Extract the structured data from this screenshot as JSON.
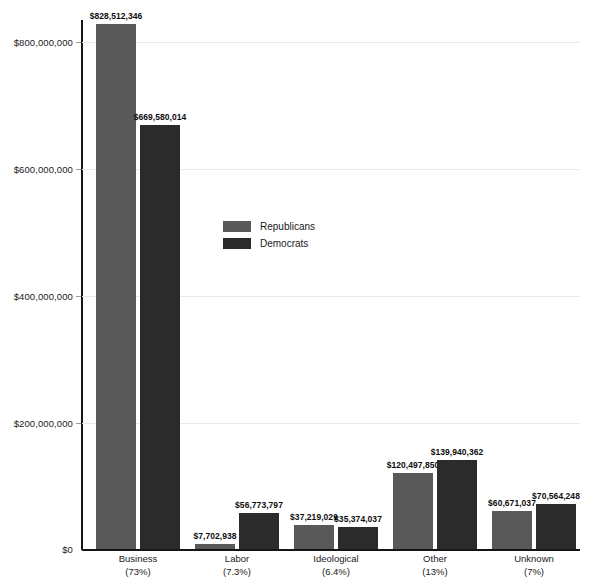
{
  "chart_data": {
    "type": "bar",
    "title": "",
    "subtitle": "",
    "xlabel": "",
    "ylabel": "",
    "grid": true,
    "legend_position": "inside-upper-center",
    "ylim": [
      0,
      800000000
    ],
    "yticks": [
      0,
      200000000,
      400000000,
      600000000,
      800000000
    ],
    "ytick_labels": [
      "$0",
      "$200,000,000",
      "$400,000,000",
      "$600,000,000",
      "$800,000,000"
    ],
    "categories": [
      "Business",
      "Labor",
      "Ideological",
      "Other",
      "Unknown"
    ],
    "category_percents": [
      "(73%)",
      "(7.3%)",
      "(6.4%)",
      "(13%)",
      "(7%)"
    ],
    "series": [
      {
        "name": "Republicans",
        "color": "#595959",
        "values": [
          828512346,
          7702938,
          37219029,
          120497850,
          60671037
        ],
        "value_labels": [
          "$828,512,346",
          "$7,702,938",
          "$37,219,029",
          "$120,497,850",
          "$60,671,037"
        ]
      },
      {
        "name": "Democrats",
        "color": "#2b2b2b",
        "values": [
          669580014,
          56773797,
          35374037,
          139940362,
          70564248
        ],
        "value_labels": [
          "$669,580,014",
          "$56,773,797",
          "$35,374,037",
          "$139,940,362",
          "$70,564,248"
        ]
      }
    ]
  },
  "legend": {
    "items": [
      {
        "label": "Republicans",
        "color": "#595959"
      },
      {
        "label": "Democrats",
        "color": "#2b2b2b"
      }
    ]
  },
  "axis": {
    "y_tick_labels": [
      "$800,000,000",
      "$600,000,000",
      "$400,000,000",
      "$200,000,000",
      "$0"
    ]
  }
}
